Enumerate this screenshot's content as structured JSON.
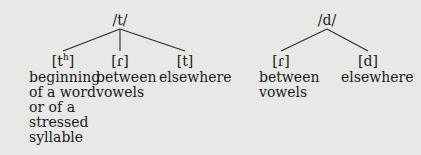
{
  "trees": [
    {
      "root": "/t/",
      "children": [
        {
          "label_base": "[t",
          "label_sup": "h",
          "label_end": "]",
          "description": "beginning\nof a word\nor of a\nstressed\nsyllable"
        },
        {
          "label": "[ɾ]",
          "description": "between\nvowels"
        },
        {
          "label": "[t]",
          "description": "elsewhere"
        }
      ]
    },
    {
      "root": "/d/",
      "children": [
        {
          "label": "[ɾ]",
          "description": "between\nvowels"
        },
        {
          "label": "[d]",
          "description": "elsewhere"
        }
      ]
    }
  ],
  "colors": {
    "background": "#e8e8e6",
    "text": "#1a1a1a",
    "lines": "#2a2a2a"
  }
}
